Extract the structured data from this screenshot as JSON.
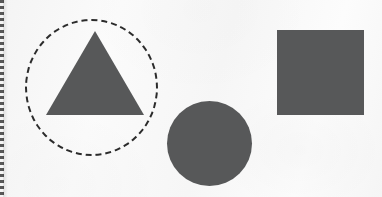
{
  "figure": {
    "title": "Geometric shapes on paper",
    "background_color": "#fafafa",
    "shape_fill_color": "#575859",
    "outline_color": "#2b2b2b",
    "canvas": {
      "width": 382,
      "height": 197
    }
  },
  "page_edge": {
    "name": "perforated-left-edge",
    "color": "#3c3c3c",
    "style": "dashed-perforation"
  },
  "shapes": [
    {
      "id": "dashed-circle",
      "kind": "circle",
      "style": "dashed-outline",
      "label": "Dashed circle outline",
      "fill": "none",
      "stroke": "#2b2b2b",
      "stroke_width": 3,
      "dash": "dashed",
      "center_x": 91,
      "center_y": 87,
      "width": 133,
      "height": 137
    },
    {
      "id": "triangle",
      "kind": "triangle",
      "style": "filled",
      "label": "Filled triangle",
      "fill": "#575859",
      "apex_x": 95,
      "apex_y": 31,
      "base_left_x": 46,
      "base_right_x": 144,
      "base_y": 115,
      "width": 98,
      "height": 84
    },
    {
      "id": "filled-circle",
      "kind": "circle",
      "style": "filled",
      "label": "Filled circle",
      "fill": "#575859",
      "center_x": 209,
      "center_y": 143,
      "width": 85,
      "height": 85
    },
    {
      "id": "filled-square",
      "kind": "square",
      "style": "filled",
      "label": "Filled square",
      "fill": "#575859",
      "left": 277,
      "top": 30,
      "width": 87,
      "height": 85
    }
  ]
}
